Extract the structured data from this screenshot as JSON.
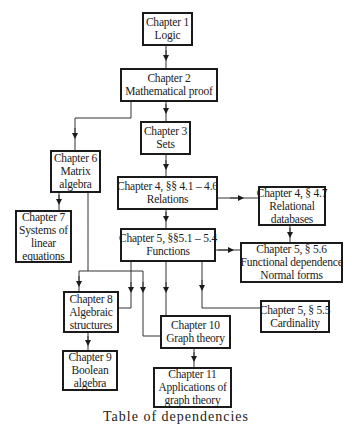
{
  "diagram": {
    "type": "chapter-dependency-flowchart",
    "nodes": [
      {
        "id": "ch1",
        "lines": [
          "Chapter 1",
          "Logic"
        ]
      },
      {
        "id": "ch2",
        "lines": [
          "Chapter 2",
          "Mathematical proof"
        ]
      },
      {
        "id": "ch3",
        "lines": [
          "Chapter 3",
          "Sets"
        ]
      },
      {
        "id": "ch4a",
        "lines": [
          "Chapter 4, §§ 4.1 – 4.6",
          "Relations"
        ]
      },
      {
        "id": "ch4b",
        "lines": [
          "Chapter 4, § 4.7",
          "Relational",
          "databases"
        ]
      },
      {
        "id": "ch5a",
        "lines": [
          "Chapter 5, §§5.1 – 5.4",
          "Functions"
        ]
      },
      {
        "id": "ch5c",
        "lines": [
          "Chapter 5, § 5.6",
          "Functional dependence",
          "Normal forms"
        ]
      },
      {
        "id": "ch5b",
        "lines": [
          "Chapter 5, § 5.5",
          "Cardinality"
        ]
      },
      {
        "id": "ch6",
        "lines": [
          "Chapter 6",
          "Matrix",
          "algebra"
        ]
      },
      {
        "id": "ch7",
        "lines": [
          "Chapter 7",
          "Systems of",
          "linear",
          "equations"
        ]
      },
      {
        "id": "ch8",
        "lines": [
          "Chapter 8",
          "Algebraic",
          "structures"
        ]
      },
      {
        "id": "ch9",
        "lines": [
          "Chapter 9",
          "Boolean",
          "algebra"
        ]
      },
      {
        "id": "ch10",
        "lines": [
          "Chapter 10",
          "Graph theory"
        ]
      },
      {
        "id": "ch11",
        "lines": [
          "Chapter 11",
          "Applications of",
          "graph theory"
        ]
      }
    ],
    "edges": [
      {
        "from": "ch1",
        "to": "ch2"
      },
      {
        "from": "ch2",
        "to": "ch3"
      },
      {
        "from": "ch2",
        "to": "ch6"
      },
      {
        "from": "ch3",
        "to": "ch4a"
      },
      {
        "from": "ch4a",
        "to": "ch4b"
      },
      {
        "from": "ch4a",
        "to": "ch5a"
      },
      {
        "from": "ch4b",
        "to": "ch5c"
      },
      {
        "from": "ch5a",
        "to": "ch5c"
      },
      {
        "from": "ch5a",
        "to": "ch8"
      },
      {
        "from": "ch5a",
        "to": "ch10"
      },
      {
        "from": "ch5a",
        "to": "ch5b"
      },
      {
        "from": "ch6",
        "to": "ch7"
      },
      {
        "from": "ch6",
        "to": "ch8"
      },
      {
        "from": "ch6",
        "to": "ch10"
      },
      {
        "from": "ch8",
        "to": "ch9"
      },
      {
        "from": "ch10",
        "to": "ch11"
      }
    ],
    "caption": "Table of dependencies"
  }
}
